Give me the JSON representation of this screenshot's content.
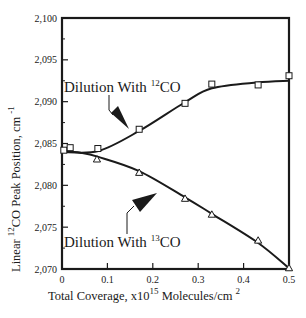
{
  "chart_data": {
    "type": "line",
    "title": "",
    "xlabel": "Total Coverage, x10^15 Molecules/cm^2",
    "xlabel_parts": {
      "pre": "Total Coverage, x10",
      "sup1": "15",
      "mid": " Molecules/cm ",
      "sup2": "2"
    },
    "ylabel": "Linear 12CO Peak Position, cm-1",
    "ylabel_parts": {
      "pre": "Linear ",
      "sup1": "12",
      "mid": "CO Peak Position, cm ",
      "sup2": "-1"
    },
    "xlim": [
      0,
      0.5
    ],
    "ylim": [
      2070,
      2100
    ],
    "x_ticks": [
      0,
      0.1,
      0.2,
      0.3,
      0.4,
      0.5
    ],
    "x_tick_labels": [
      "0",
      "0.1",
      "0.2",
      "0.3",
      "0.4",
      "0.5"
    ],
    "y_ticks": [
      2070,
      2075,
      2080,
      2085,
      2090,
      2095,
      2100
    ],
    "y_tick_labels": [
      "2,070",
      "2,075",
      "2,080",
      "2,085",
      "2,090",
      "2,095",
      "2,100"
    ],
    "grid": false,
    "legend": "none (inline annotations)",
    "series": [
      {
        "name": "Dilution With 12CO",
        "marker": "square",
        "x": [
          0.004,
          0.018,
          0.079,
          0.17,
          0.271,
          0.33,
          0.432,
          0.5
        ],
        "y": [
          2084.2,
          2084.5,
          2084.4,
          2086.7,
          2089.8,
          2092.1,
          2092.0,
          2093.1
        ],
        "curve_x": [
          0.0,
          0.08,
          0.17,
          0.27,
          0.33,
          0.43,
          0.5
        ],
        "curve_y": [
          2084.0,
          2084.1,
          2086.5,
          2089.9,
          2091.6,
          2092.3,
          2092.5
        ]
      },
      {
        "name": "Dilution With 13CO",
        "marker": "triangle",
        "x": [
          0.077,
          0.17,
          0.271,
          0.33,
          0.432,
          0.5
        ],
        "y": [
          2083.1,
          2081.5,
          2078.4,
          2076.5,
          2073.4,
          2070.1
        ],
        "curve_x": [
          0.0,
          0.04,
          0.08,
          0.17,
          0.27,
          0.33,
          0.43,
          0.5
        ],
        "curve_y": [
          2084.1,
          2083.9,
          2083.4,
          2081.7,
          2078.6,
          2076.6,
          2073.2,
          2070.1
        ]
      }
    ],
    "annotations": [
      {
        "text_pre": "Dilution With ",
        "sup": "12",
        "text_post": "CO",
        "series": "Dilution With 12CO"
      },
      {
        "text_pre": "Dilution With ",
        "sup": "13",
        "text_post": "CO",
        "series": "Dilution With 13CO"
      }
    ]
  },
  "style": {
    "line_color": "#1a1a1a",
    "background": "#ffffff"
  }
}
